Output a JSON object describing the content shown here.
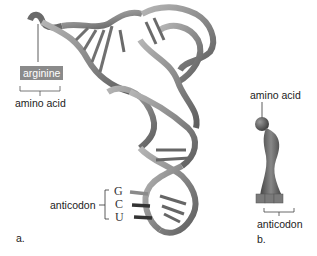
{
  "figure": {
    "panel_a": {
      "panel_label": "a.",
      "amino_acid_name": "arginine",
      "amino_acid_label": "amino acid",
      "anticodon_label": "anticodon",
      "anticodon_bases": [
        "G",
        "C",
        "U"
      ]
    },
    "panel_b": {
      "panel_label": "b.",
      "amino_acid_label": "amino acid",
      "anticodon_label": "anticodon"
    },
    "colors": {
      "ribbon_light": "#a8a8a8",
      "ribbon_dark": "#555555",
      "arginine_box": "#8a8a8a",
      "text": "#222222"
    }
  }
}
